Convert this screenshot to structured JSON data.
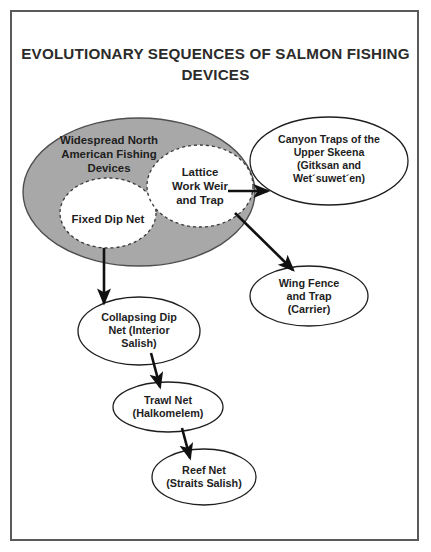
{
  "figure": {
    "title": "EVOLUTIONARY SEQUENCES OF SALMON\nFISHING DEVICES",
    "frame_color": "#5a5a5a",
    "background_color": "#ffffff"
  },
  "colors": {
    "group_fill": "#a8a8a8",
    "group_stroke": "#4f4f4f",
    "node_fill": "#ffffff",
    "node_stroke": "#1e1e1e",
    "inner_node_stroke": "#3a3a3a",
    "arrow_color": "#111111",
    "text_color": "#1e1e1e"
  },
  "diagram": {
    "type": "flow-diagram",
    "group": {
      "id": "widespread-group",
      "label": "Widespread North\nAmerican Fishing\nDevices",
      "shape": "ellipse",
      "fill": "#a8a8a8",
      "cx": 139,
      "cy": 192,
      "rx": 116,
      "ry": 74
    },
    "nodes": [
      {
        "id": "fixed-dip-net",
        "label": "Fixed Dip Net",
        "shape": "ellipse",
        "style": "dashed",
        "fill": "#ffffff",
        "cx": 108,
        "cy": 213,
        "rx": 48,
        "ry": 35
      },
      {
        "id": "lattice-work-weir",
        "label": "Lattice\nWork Weir\nand Trap",
        "shape": "ellipse",
        "style": "dashed",
        "fill": "#ffffff",
        "cx": 200,
        "cy": 186,
        "rx": 53,
        "ry": 41
      },
      {
        "id": "canyon-traps",
        "label": "Canyon Traps of the\nUpper Skeena\n(Gitksan and\nWet´suwet´en)",
        "shape": "ellipse",
        "style": "solid",
        "fill": "#ffffff",
        "cx": 329,
        "cy": 161,
        "rx": 79,
        "ry": 44
      },
      {
        "id": "wing-fence-and-trap",
        "label": "Wing Fence\nand Trap\n(Carrier)",
        "shape": "ellipse",
        "style": "solid",
        "fill": "#ffffff",
        "cx": 309,
        "cy": 296,
        "rx": 59,
        "ry": 30
      },
      {
        "id": "collapsing-dip-net",
        "label": "Collapsing Dip\nNet (Interior\nSalish)",
        "shape": "ellipse",
        "style": "solid",
        "fill": "#ffffff",
        "cx": 139,
        "cy": 331,
        "rx": 61,
        "ry": 34
      },
      {
        "id": "trawl-net",
        "label": "Trawl Net\n(Halkomelem)",
        "shape": "ellipse",
        "style": "solid",
        "fill": "#ffffff",
        "cx": 168,
        "cy": 407,
        "rx": 55,
        "ry": 25
      },
      {
        "id": "reef-net",
        "label": "Reef Net\n(Straits Salish)",
        "shape": "ellipse",
        "style": "solid",
        "fill": "#ffffff",
        "cx": 204,
        "cy": 477,
        "rx": 52,
        "ry": 28
      }
    ],
    "edges": [
      {
        "id": "edge-lattice-to-canyon",
        "from": "lattice-work-weir",
        "to": "canyon-traps"
      },
      {
        "id": "edge-lattice-to-wing-fence",
        "from": "lattice-work-weir",
        "to": "wing-fence-and-trap"
      },
      {
        "id": "edge-fixed-dip-to-collapsing",
        "from": "fixed-dip-net",
        "to": "collapsing-dip-net"
      },
      {
        "id": "edge-collapsing-to-trawl",
        "from": "collapsing-dip-net",
        "to": "trawl-net"
      },
      {
        "id": "edge-trawl-to-reef",
        "from": "trawl-net",
        "to": "reef-net"
      }
    ]
  }
}
